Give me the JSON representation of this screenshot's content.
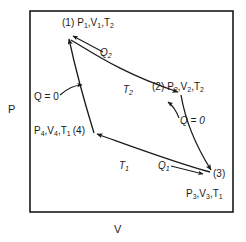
{
  "figure": {
    "type": "pv-diagram",
    "axes": {
      "y_label": "P",
      "x_label": "V"
    },
    "frame": {
      "x": 30,
      "y": 11,
      "width": 203,
      "height": 201,
      "color": "#1a1a1a"
    }
  },
  "states": {
    "one": {
      "index": "(1)",
      "pressure": "P",
      "pressure_sub": "1",
      "volume": "V",
      "volume_sub": "1",
      "temperature": "T",
      "temperature_sub": "2",
      "full": "(1) P1,V1,T2"
    },
    "two": {
      "index": "(2)",
      "pressure": "P",
      "pressure_sub": "2",
      "volume": "V",
      "volume_sub": "2",
      "temperature": "T",
      "temperature_sub": "2",
      "full": "(2) P2,V2,T2"
    },
    "three": {
      "index": "(3)",
      "pressure": "P",
      "pressure_sub": "3",
      "volume": "V",
      "volume_sub": "3",
      "temperature": "T",
      "temperature_sub": "1",
      "full": "(3) P3,V3,T1"
    },
    "four": {
      "index": "(4)",
      "pressure": "P",
      "pressure_sub": "4",
      "volume": "V",
      "volume_sub": "4",
      "temperature": "T",
      "temperature_sub": "1",
      "full": "P4,V4,T1 (4)"
    }
  },
  "processes": {
    "isotherm_upper": {
      "heat": "Q",
      "heat_sub": "2",
      "temperature": "T",
      "temperature_sub": "2",
      "from": "(1)",
      "to": "(2)"
    },
    "isotherm_lower": {
      "heat": "Q",
      "heat_sub": "1",
      "temperature": "T",
      "temperature_sub": "1",
      "from": "(3)",
      "to": "(4)"
    },
    "adiabat_left": {
      "label": "Q = 0",
      "from": "(4)",
      "to": "(1)"
    },
    "adiabat_right": {
      "label": "Q = 0",
      "from": "(2)",
      "to": "(3)"
    }
  },
  "colors": {
    "ink": "#1a1a1a",
    "background": "#ffffff"
  }
}
